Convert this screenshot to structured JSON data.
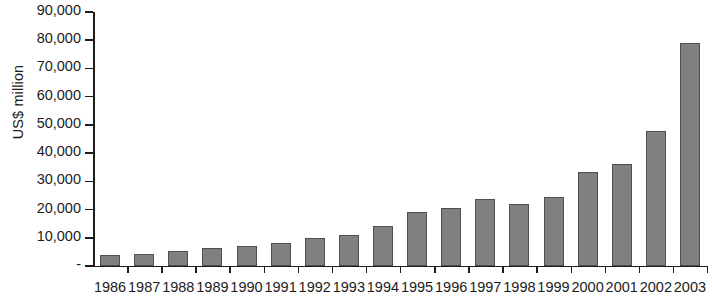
{
  "chart_data": {
    "type": "bar",
    "title": "",
    "xlabel": "",
    "ylabel": "US$ million",
    "categories": [
      "1986",
      "1987",
      "1988",
      "1989",
      "1990",
      "1991",
      "1992",
      "1993",
      "1994",
      "1995",
      "1996",
      "1997",
      "1998",
      "1999",
      "2000",
      "2001",
      "2002",
      "2003"
    ],
    "values": [
      3900,
      4300,
      5400,
      6500,
      7200,
      8200,
      10000,
      11100,
      14000,
      19300,
      20500,
      23800,
      21800,
      24300,
      33300,
      36000,
      48000,
      79000
    ],
    "series": [
      {
        "name": "US$ million",
        "values": [
          3900,
          4300,
          5400,
          6500,
          7200,
          8200,
          10000,
          11100,
          14000,
          19300,
          20500,
          23800,
          21800,
          24300,
          33300,
          36000,
          48000,
          79000
        ]
      }
    ],
    "ylim": [
      0,
      90000
    ],
    "y_ticks": [
      0,
      10000,
      20000,
      30000,
      40000,
      50000,
      60000,
      70000,
      80000,
      90000
    ],
    "y_tick_labels": [
      "-",
      "10,000",
      "20,000",
      "30,000",
      "40,000",
      "50,000",
      "60,000",
      "70,000",
      "80,000",
      "90,000"
    ],
    "grid": false,
    "legend": false,
    "legend_position": "none",
    "bar_color": "#808080",
    "bar_border_color": "#4f4f4f",
    "axis_color": "#1c1c1c",
    "background_color": "#ffffff"
  }
}
